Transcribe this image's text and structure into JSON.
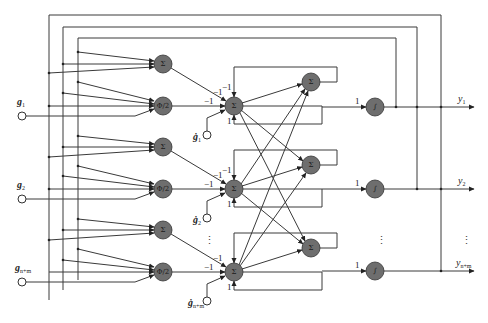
{
  "diagram": {
    "title": "",
    "colors": {
      "node_fill": "#6e6e6e",
      "wire": "#3a3a3a",
      "background": "#ffffff"
    },
    "inputs": [
      {
        "label": "g",
        "sub": "1",
        "x": 22,
        "y": 116
      },
      {
        "label": "g",
        "sub": "2",
        "x": 22,
        "y": 199
      },
      {
        "label": "g",
        "sub": "n+m",
        "x": 22,
        "y": 282
      }
    ],
    "derivative_inputs": [
      {
        "label": "ġ",
        "sub": "1",
        "x": 207,
        "y": 135
      },
      {
        "label": "ġ",
        "sub": "2",
        "x": 207,
        "y": 218
      },
      {
        "label": "ġ",
        "sub": "n+m",
        "x": 207,
        "y": 301
      }
    ],
    "left_sum_nodes": [
      {
        "label": "Σ",
        "x": 163,
        "y": 64
      },
      {
        "label": "Σ",
        "x": 163,
        "y": 147
      },
      {
        "label": "Σ",
        "x": 163,
        "y": 230
      }
    ],
    "phi_nodes": [
      {
        "label": "Φ/2",
        "x": 163,
        "y": 106
      },
      {
        "label": "Φ/2",
        "x": 163,
        "y": 189
      },
      {
        "label": "Φ/2",
        "x": 163,
        "y": 272
      }
    ],
    "mid_sum_nodes": [
      {
        "label": "Σ",
        "x": 234,
        "y": 106
      },
      {
        "label": "Σ",
        "x": 234,
        "y": 189
      },
      {
        "label": "Σ",
        "x": 234,
        "y": 272
      }
    ],
    "right_sum_nodes": [
      {
        "label": "Σ",
        "x": 311,
        "y": 82
      },
      {
        "label": "Σ",
        "x": 311,
        "y": 165
      },
      {
        "label": "Σ",
        "x": 311,
        "y": 248
      }
    ],
    "integrator_nodes": [
      {
        "label": "∫",
        "x": 375,
        "y": 107
      },
      {
        "label": "∫",
        "x": 375,
        "y": 189
      },
      {
        "label": "∫",
        "x": 375,
        "y": 271
      }
    ],
    "outputs": [
      {
        "label": "y",
        "sub": "1",
        "x": 463,
        "y": 101
      },
      {
        "label": "y",
        "sub": "2",
        "x": 463,
        "y": 183
      },
      {
        "label": "y",
        "sub": "n+m",
        "x": 461,
        "y": 265
      }
    ],
    "weights": {
      "minus_one": "−1",
      "one": "1"
    },
    "ellipsis": "⋮"
  }
}
